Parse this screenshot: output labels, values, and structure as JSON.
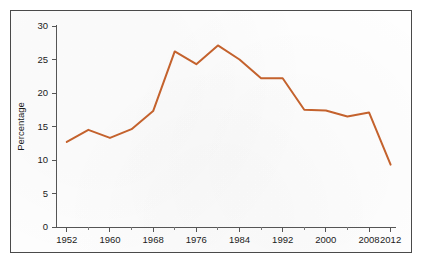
{
  "chart_data": {
    "type": "line",
    "title": "",
    "subtitle": "",
    "xlabel": "",
    "ylabel": "Percentage",
    "xlim": [
      1950,
      2013
    ],
    "ylim": [
      0,
      30
    ],
    "grid": false,
    "legend": null,
    "legend_position": "none",
    "line_color": "#c4622d",
    "x_tick_labels": [
      "1952",
      "1960",
      "1968",
      "1976",
      "1984",
      "1992",
      "2000",
      "2008",
      "2012"
    ],
    "x_tick_values": [
      1952,
      1960,
      1968,
      1976,
      1984,
      1992,
      2000,
      2008,
      2012
    ],
    "x_minor_tick_values": [
      1956,
      1964,
      1972,
      1980,
      1988,
      1996,
      2004
    ],
    "y_tick_labels": [
      "0",
      "5",
      "10",
      "15",
      "20",
      "25",
      "30"
    ],
    "y_tick_values": [
      0,
      5,
      10,
      15,
      20,
      25,
      30
    ],
    "x": [
      1952,
      1956,
      1960,
      1964,
      1968,
      1972,
      1976,
      1980,
      1984,
      1988,
      1992,
      1996,
      2000,
      2004,
      2008,
      2012
    ],
    "values": [
      12.7,
      14.5,
      13.3,
      14.6,
      17.3,
      26.2,
      24.3,
      27.1,
      25.0,
      22.2,
      22.2,
      17.5,
      17.4,
      16.5,
      17.1,
      9.3
    ],
    "series": [
      {
        "name": "Percentage",
        "color": "#c4622d",
        "values": [
          12.7,
          14.5,
          13.3,
          14.6,
          17.3,
          26.2,
          24.3,
          27.1,
          25.0,
          22.2,
          22.2,
          17.5,
          17.4,
          16.5,
          17.1,
          9.3
        ]
      }
    ]
  }
}
